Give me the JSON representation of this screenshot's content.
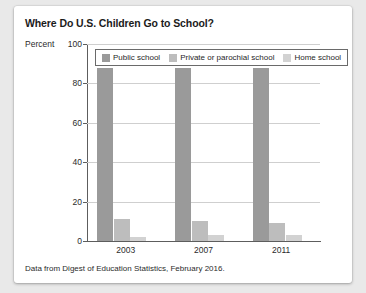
{
  "card": {
    "background": "#ffffff",
    "page_background": "#e9e9e9"
  },
  "chart_data": {
    "type": "bar",
    "title": "Where Do U.S. Children Go to School?",
    "xlabel": "",
    "ylabel": "Percent",
    "ylim": [
      0,
      100
    ],
    "yticks": [
      0,
      20,
      40,
      60,
      80,
      100
    ],
    "grid": true,
    "legend_position": "top-inside",
    "categories": [
      "2003",
      "2007",
      "2011"
    ],
    "series": [
      {
        "name": "Public school",
        "color": "#9a9a9a",
        "values": [
          88,
          88,
          88
        ]
      },
      {
        "name": "Private or parochial school",
        "color": "#bdbdbd",
        "values": [
          11,
          10,
          9
        ]
      },
      {
        "name": "Home school",
        "color": "#d2d2d2",
        "values": [
          2,
          3,
          3
        ]
      }
    ],
    "source_note": "Data from Digest of Education Statistics, February 2016."
  }
}
